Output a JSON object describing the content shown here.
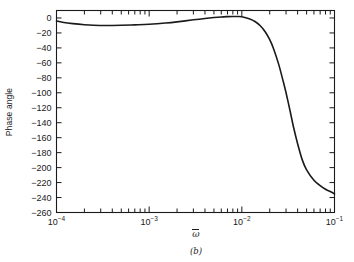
{
  "figure": {
    "caption": "(b)",
    "axis_x_label_base": "ω",
    "axis_y_label": "Phase angle",
    "line_color": "#1a1a1a",
    "axis_color": "#1a1a1a",
    "background": "#ffffff"
  },
  "chart_data": {
    "type": "line",
    "title": "",
    "subtitle": "",
    "caption": "(b)",
    "xlabel": "ω̄",
    "ylabel": "Phase angle",
    "xscale": "log",
    "yscale": "linear",
    "xlim": [
      0.0001,
      0.1
    ],
    "ylim": [
      -260,
      10
    ],
    "grid": false,
    "legend": null,
    "xtick_labels": [
      "10⁻⁴",
      "10⁻³",
      "10⁻²",
      "10⁻¹"
    ],
    "xtick_values": [
      0.0001,
      0.001,
      0.01,
      0.1
    ],
    "xtick_mantissas": [
      "10",
      "10",
      "10",
      "10"
    ],
    "xtick_exponents": [
      "-4",
      "-3",
      "-2",
      "-1"
    ],
    "ytick_labels": [
      "0",
      "−20",
      "−40",
      "−60",
      "−80",
      "−100",
      "−120",
      "−140",
      "−160",
      "−180",
      "−200",
      "−220",
      "−240",
      "−260"
    ],
    "ytick_values": [
      0,
      -20,
      -40,
      -60,
      -80,
      -100,
      -120,
      -140,
      -160,
      -180,
      -200,
      -220,
      -240,
      -260
    ],
    "minor_ticks_x": "log decades 2-9",
    "series": [
      {
        "name": "phase",
        "x": [
          0.0001,
          0.00012,
          0.00015,
          0.0002,
          0.00025,
          0.0003,
          0.0004,
          0.0005,
          0.0007,
          0.001,
          0.0015,
          0.002,
          0.003,
          0.004,
          0.005,
          0.006,
          0.007,
          0.008,
          0.009,
          0.01,
          0.012,
          0.014,
          0.016,
          0.018,
          0.02,
          0.022,
          0.025,
          0.028,
          0.03,
          0.033,
          0.036,
          0.04,
          0.045,
          0.05,
          0.06,
          0.07,
          0.08,
          0.09,
          0.1
        ],
        "y": [
          -4,
          -6,
          -7.5,
          -9,
          -9.8,
          -10,
          -10,
          -9.8,
          -9.2,
          -8.4,
          -6.8,
          -5.2,
          -2.4,
          -0.6,
          0.6,
          1.4,
          1.8,
          2,
          2,
          1.6,
          -1,
          -5,
          -11,
          -19,
          -29,
          -41,
          -62,
          -85,
          -100,
          -123,
          -145,
          -168,
          -190,
          -203,
          -217,
          -224,
          -229,
          -232,
          -235
        ]
      }
    ]
  }
}
